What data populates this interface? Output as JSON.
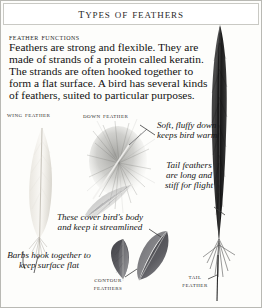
{
  "page": {
    "title": "Types of Feathers",
    "subhead": "Feather functions",
    "intro": "Feathers are strong and flexible. They are made of strands of a protein called keratin. The strands are often hooked together to form a flat surface. A bird has several kinds of feathers, suited to particular purposes."
  },
  "labels": {
    "wing": "Wing feather",
    "down": "Down feather",
    "contour": "Contour feathers",
    "tail": "Tail feather"
  },
  "annotations": {
    "down": "Soft, fluffy down keeps bird warm",
    "tail": "Tail feathers are long and stiff for flight",
    "contour": "These cover bird's body and keep it streamlined",
    "barbs": "Barbs hook together to keep surface flat"
  },
  "colors": {
    "page_background": "#fdfdfb",
    "border": "#b9b9b4",
    "text": "#111111",
    "wing_feather": "#ece9e2",
    "down_feather": "#9a9a96",
    "contour_feather": "#565659",
    "tail_feather": "#1c1c1c"
  }
}
